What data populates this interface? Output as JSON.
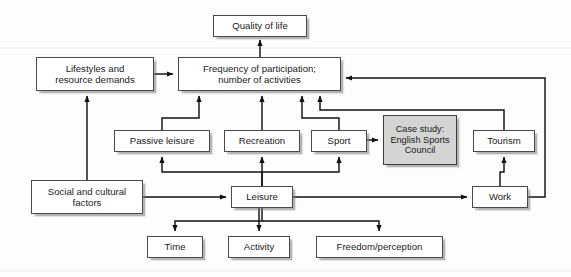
{
  "diagram": {
    "type": "flow-diagram",
    "background_color": "#fdfdfd",
    "box_fill_color": "#ffffff",
    "shaded_box_fill_color": "#d4d4d4",
    "line_color": "#1a1a1a",
    "nodes": [
      {
        "id": "quality_of_life",
        "label": "Quality of life",
        "x": 213,
        "y": 15,
        "w": 94,
        "h": 22,
        "shaded": false,
        "font": "fs95"
      },
      {
        "id": "lifestyles",
        "label": "Lifestyles and\nresource demands",
        "x": 36,
        "y": 57,
        "w": 118,
        "h": 34,
        "shaded": false,
        "font": "fs95"
      },
      {
        "id": "frequency",
        "label": "Frequency of participation;\nnumber of activities",
        "x": 178,
        "y": 57,
        "w": 163,
        "h": 34,
        "shaded": false,
        "font": "fs95"
      },
      {
        "id": "passive_leisure",
        "label": "Passive leisure",
        "x": 114,
        "y": 130,
        "w": 96,
        "h": 22,
        "shaded": false,
        "font": "fs95"
      },
      {
        "id": "recreation",
        "label": "Recreation",
        "x": 224,
        "y": 130,
        "w": 76,
        "h": 22,
        "shaded": false,
        "font": "fs95"
      },
      {
        "id": "sport",
        "label": "Sport",
        "x": 311,
        "y": 130,
        "w": 56,
        "h": 22,
        "shaded": false,
        "font": "fs95"
      },
      {
        "id": "case_study",
        "label": "Case study:\nEnglish Sports\nCouncil",
        "x": 383,
        "y": 115,
        "w": 74,
        "h": 50,
        "shaded": true,
        "font": "fs9"
      },
      {
        "id": "tourism",
        "label": "Tourism",
        "x": 473,
        "y": 130,
        "w": 62,
        "h": 22,
        "shaded": false,
        "font": "fs95"
      },
      {
        "id": "social_cultural",
        "label": "Social and cultural\nfactors",
        "x": 31,
        "y": 180,
        "w": 112,
        "h": 34,
        "shaded": false,
        "font": "fs95"
      },
      {
        "id": "leisure",
        "label": "Leisure",
        "x": 231,
        "y": 186,
        "w": 62,
        "h": 22,
        "shaded": false,
        "font": "fs95"
      },
      {
        "id": "work",
        "label": "Work",
        "x": 472,
        "y": 186,
        "w": 56,
        "h": 22,
        "shaded": false,
        "font": "fs95"
      },
      {
        "id": "time",
        "label": "Time",
        "x": 147,
        "y": 236,
        "w": 56,
        "h": 22,
        "shaded": false,
        "font": "fs95"
      },
      {
        "id": "activity",
        "label": "Activity",
        "x": 228,
        "y": 236,
        "w": 62,
        "h": 22,
        "shaded": false,
        "font": "fs95"
      },
      {
        "id": "freedom",
        "label": "Freedom/perception",
        "x": 316,
        "y": 236,
        "w": 127,
        "h": 22,
        "shaded": false,
        "font": "fs95"
      }
    ],
    "edges": [
      {
        "id": "frequency-to-quality",
        "from": "frequency",
        "to": "quality_of_life"
      },
      {
        "id": "lifestyles-to-frequency",
        "from": "lifestyles",
        "to": "frequency"
      },
      {
        "id": "social-to-lifestyles",
        "from": "social_cultural",
        "to": "lifestyles"
      },
      {
        "id": "social-to-leisure",
        "from": "social_cultural",
        "to": "leisure"
      },
      {
        "id": "passive-leisure-to-frequency",
        "from": "passive_leisure",
        "to": "frequency"
      },
      {
        "id": "recreation-to-frequency",
        "from": "recreation",
        "to": "frequency"
      },
      {
        "id": "sport-to-frequency",
        "from": "sport",
        "to": "frequency"
      },
      {
        "id": "tourism-to-frequency",
        "from": "tourism",
        "to": "frequency"
      },
      {
        "id": "work-to-frequency",
        "from": "work",
        "to": "frequency"
      },
      {
        "id": "leisure-to-passive-leisure",
        "from": "leisure",
        "to": "passive_leisure"
      },
      {
        "id": "leisure-to-recreation",
        "from": "leisure",
        "to": "recreation"
      },
      {
        "id": "leisure-to-sport",
        "from": "leisure",
        "to": "sport"
      },
      {
        "id": "work-to-tourism",
        "from": "work",
        "to": "tourism"
      },
      {
        "id": "leisure-work-bidirectional",
        "from": "leisure",
        "to": "work"
      },
      {
        "id": "sport-to-case-study",
        "from": "sport",
        "to": "case_study"
      },
      {
        "id": "leisure-to-time",
        "from": "leisure",
        "to": "time"
      },
      {
        "id": "leisure-to-activity",
        "from": "leisure",
        "to": "activity"
      },
      {
        "id": "leisure-to-freedom",
        "from": "leisure",
        "to": "freedom"
      }
    ]
  }
}
